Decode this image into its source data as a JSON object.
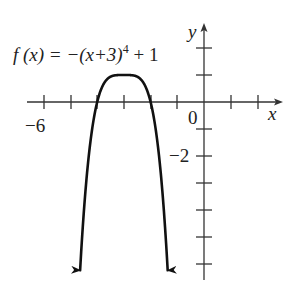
{
  "chart_data": {
    "type": "line",
    "xlabel": "x",
    "ylabel": "y",
    "xlim": [
      -6.5,
      2.8
    ],
    "ylim": [
      -6.5,
      2.8
    ],
    "x_tick_labels": [
      "-6",
      "0"
    ],
    "y_tick_labels": [
      "-2"
    ],
    "x_ticks": [
      -6,
      -5,
      -4,
      -3,
      -2,
      -1,
      1,
      2
    ],
    "y_ticks": [
      2,
      1,
      -1,
      -2,
      -3,
      -4,
      -5,
      -6
    ],
    "grid": false,
    "legend": null,
    "series": [
      {
        "name": "f(x) = −(x+3)⁴ + 1",
        "function": "-(x+3)^4+1",
        "x": [
          -4.65,
          -4.5,
          -4.25,
          -4.0,
          -3.75,
          -3.5,
          -3.25,
          -3.0,
          -2.75,
          -2.5,
          -2.25,
          -2.0,
          -1.75,
          -1.5,
          -1.35
        ],
        "y": [
          -6.4,
          -4.06,
          -1.44,
          0.0,
          0.68,
          0.94,
          1.0,
          1.0,
          1.0,
          0.94,
          0.68,
          0.0,
          -1.44,
          -4.06,
          -6.4
        ],
        "end_arrows": true
      }
    ]
  },
  "labels": {
    "function": "f (x) = −(x+3)",
    "exponent": "4",
    "tail": " + 1",
    "x_axis": "x",
    "y_axis": "y",
    "minus6": "−6",
    "zero": "0",
    "minus2": "−2"
  }
}
